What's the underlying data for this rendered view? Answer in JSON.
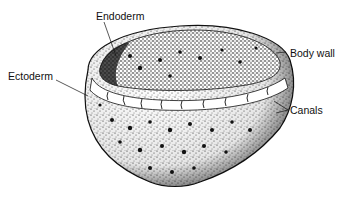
{
  "labels": {
    "endoderm": "Endoderm",
    "ectoderm": "Ectoderm",
    "body_wall": "Body wall",
    "canals": "Canals"
  },
  "colors": {
    "ink": "#111111",
    "background": "#ffffff"
  }
}
